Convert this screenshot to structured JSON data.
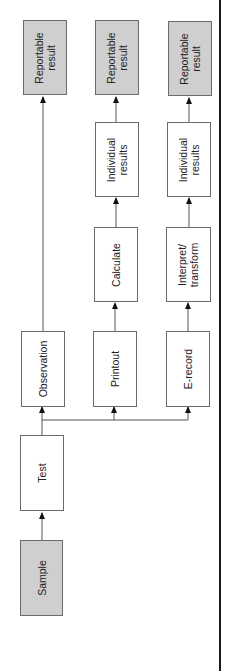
{
  "diagram": {
    "type": "flowchart",
    "orientation": "rotated -90deg (flow bottom to top)",
    "colors": {
      "terminal_fill": "#cfcfcf",
      "process_fill": "#ffffff",
      "border": "#6b6b6b",
      "frame": "#1a1a1a"
    },
    "nodes": {
      "sample": "Sample",
      "test": "Test",
      "observation": "Observation",
      "printout": "Printout",
      "erecord": "E-record",
      "calculate": "Calculate",
      "interpret": "Interpret/\ntransform",
      "individual1": "Individual\nresults",
      "individual2": "Individual\nresults",
      "reportable1": "Reportable\nresult",
      "reportable2": "Reportable\nresult",
      "reportable3": "Reportable\nresult"
    },
    "edges": [
      [
        "Sample",
        "Test"
      ],
      [
        "Test",
        "Observation"
      ],
      [
        "Test",
        "Printout"
      ],
      [
        "Test",
        "E-record"
      ],
      [
        "Observation",
        "Reportable result"
      ],
      [
        "Printout",
        "Calculate"
      ],
      [
        "Calculate",
        "Individual results"
      ],
      [
        "Individual results",
        "Reportable result"
      ],
      [
        "E-record",
        "Interpret/transform"
      ],
      [
        "Interpret/transform",
        "Individual results"
      ],
      [
        "Individual results",
        "Reportable result"
      ]
    ]
  }
}
